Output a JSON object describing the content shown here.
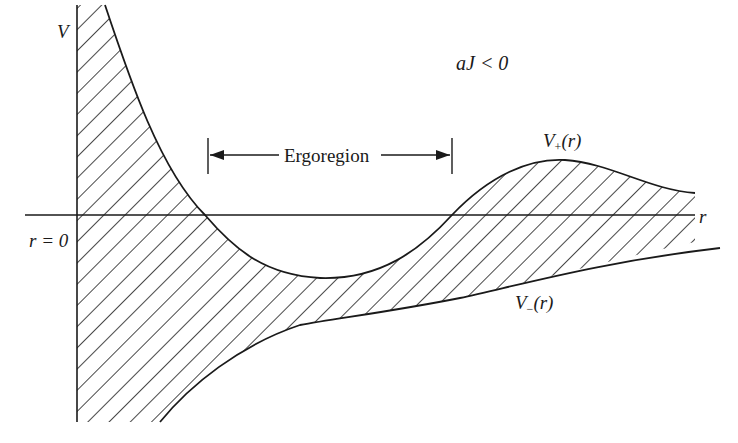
{
  "figure": {
    "condition_label": "aJ < 0",
    "axes": {
      "y_label": "V",
      "x_label": "r",
      "origin_label": "r = 0"
    },
    "region_marker": {
      "label": "Ergoregion",
      "arrow": "double-headed"
    },
    "curves": [
      {
        "name": "V_+(r)",
        "label_main": "V",
        "label_sub": "+",
        "label_arg": "(r)",
        "description": "upper potential curve"
      },
      {
        "name": "V_-(r)",
        "label_main": "V",
        "label_sub": "−",
        "label_arg": "(r)",
        "description": "lower potential curve"
      }
    ],
    "shading": "diagonal hatching between V_+(r) and V_-(r) (forbidden region)",
    "colors": {
      "line": "#1a1a1a",
      "background": "#ffffff"
    }
  }
}
